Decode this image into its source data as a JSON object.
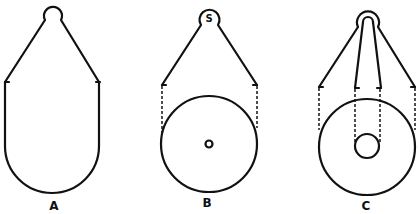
{
  "figure": {
    "line_color": "#111111",
    "background": "#ffffff",
    "panels": [
      {
        "id": "A",
        "label": "A",
        "description": "teardrop/pear outline with top loop, straight sides and rounded bottom"
      },
      {
        "id": "B",
        "label": "B",
        "loop_label": "S",
        "description": "loop S with two straight cords down to a circle with small central hole; dashed vertical tangent lines"
      },
      {
        "id": "C",
        "label": "C",
        "description": "double loop with outer cords to large circle and inner cords to small inner circle; dashed vertical tangent lines"
      }
    ]
  }
}
